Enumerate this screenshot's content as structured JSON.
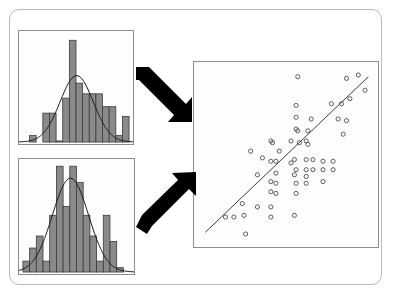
{
  "figure": {
    "background_color": "#ffffff",
    "frame_color": "#b9b9b9",
    "panel_border_color": "#8d8d8d",
    "bar_fill_color": "#8a8a8a",
    "bar_stroke_color": "#3a3a3a",
    "curve_color": "#1a1a1a",
    "arrow_color": "#000000",
    "point_stroke_color": "#4a4a4a",
    "line_color": "#3c3c3c"
  },
  "panels": {
    "hist_top": {
      "name": "Top histogram panel",
      "role": "first marginal distribution"
    },
    "hist_bottom": {
      "name": "Bottom histogram panel",
      "role": "second marginal distribution"
    },
    "scatter": {
      "name": "Scatter plot panel",
      "role": "joint distribution with fitted regression line"
    }
  },
  "arrows": {
    "top": {
      "name": "arrow-top",
      "label": "",
      "direction": "down-right",
      "from": "hist_top",
      "to": "scatter"
    },
    "bottom": {
      "name": "arrow-bottom",
      "label": "",
      "direction": "up-right",
      "from": "hist_bottom",
      "to": "scatter"
    }
  },
  "chart_data": [
    {
      "type": "bar",
      "name": "hist_top",
      "title": "",
      "xlabel": "",
      "ylabel": "",
      "grid": false,
      "legend": "none",
      "categories": [
        "1",
        "2",
        "3",
        "4",
        "5",
        "6",
        "7",
        "8",
        "9",
        "10",
        "11",
        "12",
        "13",
        "14",
        "15",
        "16"
      ],
      "values": [
        0,
        0,
        6,
        0,
        27,
        27,
        1,
        41,
        95,
        55,
        45,
        45,
        45,
        33,
        33,
        6,
        24
      ],
      "bar_values": [
        0,
        6,
        0,
        27,
        27,
        1,
        41,
        95,
        55,
        45,
        45,
        45,
        33,
        33,
        6,
        24
      ],
      "ylim": [
        0,
        100
      ],
      "overlay_curve": {
        "type": "normal_density",
        "mean_index": 7.6,
        "sd_index": 2.5,
        "peak": 62
      }
    },
    {
      "type": "bar",
      "name": "hist_bottom",
      "title": "",
      "xlabel": "",
      "ylabel": "",
      "grid": false,
      "legend": "none",
      "categories": [
        "1",
        "2",
        "3",
        "4",
        "5",
        "6",
        "7",
        "8",
        "9",
        "10",
        "11",
        "12",
        "13",
        "14",
        "15",
        "16"
      ],
      "bar_values": [
        10,
        22,
        33,
        10,
        52,
        97,
        60,
        97,
        82,
        52,
        33,
        10,
        52,
        28,
        4,
        0
      ],
      "ylim": [
        0,
        100
      ],
      "overlay_curve": {
        "type": "normal_density",
        "mean_index": 6.6,
        "sd_index": 2.7,
        "peak": 86
      }
    },
    {
      "type": "scatter",
      "name": "scatter",
      "title": "",
      "xlabel": "",
      "ylabel": "",
      "grid": false,
      "legend": "none",
      "xlim": [
        0,
        100
      ],
      "ylim": [
        0,
        100
      ],
      "marker": "open-circle",
      "points": [
        [
          57,
          96
        ],
        [
          86,
          95
        ],
        [
          93,
          97
        ],
        [
          56,
          79
        ],
        [
          77,
          80
        ],
        [
          83,
          80
        ],
        [
          88,
          83
        ],
        [
          97,
          88
        ],
        [
          56,
          72
        ],
        [
          65,
          71
        ],
        [
          81,
          71
        ],
        [
          86,
          70
        ],
        [
          56,
          65
        ],
        [
          57,
          64
        ],
        [
          63,
          64
        ],
        [
          84,
          62
        ],
        [
          41,
          58
        ],
        [
          42,
          57
        ],
        [
          53,
          58
        ],
        [
          58,
          57
        ],
        [
          62,
          58
        ],
        [
          63,
          56
        ],
        [
          29,
          52
        ],
        [
          46,
          52
        ],
        [
          36,
          48
        ],
        [
          41,
          46
        ],
        [
          44,
          46
        ],
        [
          53,
          45
        ],
        [
          55,
          47
        ],
        [
          62,
          47
        ],
        [
          66,
          47
        ],
        [
          72,
          46
        ],
        [
          78,
          46
        ],
        [
          56,
          41
        ],
        [
          62,
          41
        ],
        [
          66,
          41
        ],
        [
          72,
          41
        ],
        [
          78,
          41
        ],
        [
          33,
          38
        ],
        [
          44,
          39
        ],
        [
          55,
          38
        ],
        [
          62,
          37
        ],
        [
          41,
          34
        ],
        [
          44,
          33
        ],
        [
          56,
          33
        ],
        [
          62,
          33
        ],
        [
          72,
          34
        ],
        [
          41,
          28
        ],
        [
          44,
          27
        ],
        [
          56,
          27
        ],
        [
          24,
          21
        ],
        [
          33,
          19
        ],
        [
          41,
          19
        ],
        [
          14,
          13
        ],
        [
          19,
          13
        ],
        [
          25,
          14
        ],
        [
          41,
          13
        ],
        [
          55,
          14
        ],
        [
          26,
          3
        ]
      ],
      "fit_line": {
        "type": "linear",
        "x_start": 2,
        "y_start": 4,
        "x_end": 99,
        "y_end": 96
      }
    }
  ]
}
